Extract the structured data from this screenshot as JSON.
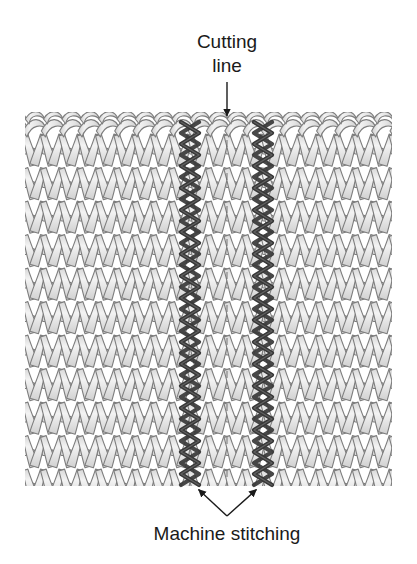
{
  "figure": {
    "type": "knitting-technique-diagram",
    "background_color": "#ffffff"
  },
  "annotations": {
    "cutting_line": {
      "label_line1": "Cutting",
      "label_line2": "line",
      "text_color": "#1a1a1a",
      "font_size_px": 19,
      "text_center_x": 227,
      "line1_baseline_y": 48,
      "line2_baseline_y": 72,
      "leader": {
        "type": "arrow-down",
        "x": 227,
        "y_start": 82,
        "y_end": 118,
        "color": "#1a1a1a"
      }
    },
    "machine_stitching": {
      "label": "Machine stitching",
      "text_color": "#1a1a1a",
      "font_size_px": 19,
      "text_center_x": 227,
      "baseline_y": 540,
      "leaders": [
        {
          "type": "arrow",
          "from_x": 227,
          "from_y": 516,
          "to_x": 196,
          "to_y": 487,
          "color": "#1a1a1a"
        },
        {
          "type": "arrow",
          "from_x": 227,
          "from_y": 516,
          "to_x": 259,
          "to_y": 487,
          "color": "#1a1a1a"
        }
      ]
    }
  },
  "fabric": {
    "name": "stockinette-knit-swatch",
    "left_x": 25,
    "right_x": 392,
    "top_y": 118,
    "bottom_y": 483,
    "yarn_fill": "#eaeaea",
    "yarn_fill_shadow": "#d2d2d2",
    "yarn_outline": "#7d7d7d",
    "outline_width": 1.1,
    "stitch_columns": 20,
    "stitch_column_width": 18.35,
    "stitch_rows": 11,
    "stitch_row_height": 33.5,
    "bind_off_row": {
      "present": true,
      "y": 133,
      "description": "chained cast-on / bind-off row across top"
    }
  },
  "machine_stitching_lines": [
    {
      "name": "left-stitch-line",
      "center_x": 190,
      "top_y": 122,
      "bottom_y": 487,
      "color": "#383838",
      "highlight_color": "#6e6e6e",
      "zigzag_amplitude": 9,
      "zigzag_period": 22,
      "stroke_width": 4.2
    },
    {
      "name": "right-stitch-line",
      "center_x": 263,
      "top_y": 122,
      "bottom_y": 487,
      "color": "#383838",
      "highlight_color": "#6e6e6e",
      "zigzag_amplitude": 9,
      "zigzag_period": 22,
      "stroke_width": 4.2
    }
  ],
  "cut_guide": {
    "name": "center-cut-dashes",
    "x": 227,
    "top_y": 140,
    "bottom_y": 480,
    "color": "#6a6a6a"
  }
}
